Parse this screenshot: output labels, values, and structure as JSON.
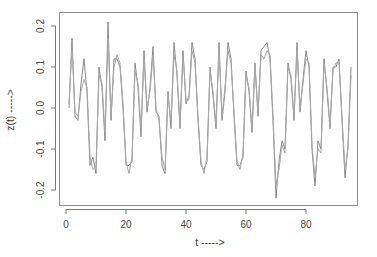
{
  "chart_data": {
    "type": "line",
    "title": "",
    "xlabel": "t ----->",
    "ylabel": "z(t) ----->",
    "xlim": [
      -1,
      97
    ],
    "ylim": [
      -0.245,
      0.23
    ],
    "xticks": [
      0,
      20,
      40,
      60,
      80
    ],
    "yticks": [
      -0.2,
      -0.1,
      0.0,
      0.1,
      0.2
    ],
    "ytick_labels": [
      "-0.2",
      "-0.1",
      "0.0",
      "0.1",
      "0.2"
    ],
    "grid": false,
    "legend": null,
    "series": [
      {
        "name": "series-1",
        "color": "#8a8a8a",
        "x": [
          1,
          2,
          3,
          4,
          5,
          6,
          7,
          8,
          9,
          10,
          11,
          12,
          13,
          14,
          15,
          16,
          17,
          18,
          19,
          20,
          21,
          22,
          23,
          24,
          25,
          26,
          27,
          28,
          29,
          30,
          31,
          32,
          33,
          34,
          35,
          36,
          37,
          38,
          39,
          40,
          41,
          42,
          43,
          44,
          45,
          46,
          47,
          48,
          49,
          50,
          51,
          52,
          53,
          54,
          55,
          56,
          57,
          58,
          59,
          60,
          61,
          62,
          63,
          64,
          65,
          66,
          67,
          68,
          69,
          70,
          71,
          72,
          73,
          74,
          75,
          76,
          77,
          78,
          79,
          80,
          81,
          82,
          83,
          84,
          85,
          86,
          87,
          88,
          89,
          90,
          91,
          92,
          93,
          94,
          95
        ],
        "values": [
          0.0,
          0.17,
          -0.02,
          -0.03,
          0.06,
          0.12,
          0.04,
          -0.14,
          -0.12,
          -0.16,
          0.1,
          0.05,
          -0.08,
          0.21,
          -0.03,
          0.12,
          0.12,
          0.1,
          0.0,
          -0.14,
          -0.14,
          -0.13,
          0.11,
          0.05,
          -0.07,
          0.14,
          -0.01,
          0.05,
          0.15,
          -0.01,
          -0.02,
          -0.14,
          -0.16,
          0.04,
          -0.05,
          0.16,
          0.08,
          -0.05,
          0.14,
          0.01,
          0.03,
          0.16,
          0.12,
          -0.03,
          -0.14,
          -0.15,
          -0.13,
          0.1,
          0.03,
          -0.05,
          0.16,
          -0.03,
          0.04,
          0.16,
          0.12,
          -0.02,
          -0.14,
          -0.14,
          -0.12,
          0.09,
          0.04,
          -0.06,
          0.11,
          -0.02,
          0.14,
          0.15,
          0.16,
          0.12,
          -0.03,
          -0.22,
          -0.13,
          -0.08,
          -0.1,
          0.11,
          0.07,
          -0.03,
          0.16,
          -0.01,
          0.07,
          0.14,
          0.1,
          -0.1,
          -0.19,
          -0.08,
          -0.1,
          0.12,
          0.04,
          -0.05,
          0.1,
          0.1,
          0.12,
          -0.03,
          -0.17,
          -0.09,
          0.1
        ]
      },
      {
        "name": "series-2",
        "color": "#a8a8a8",
        "x": [
          1,
          2,
          3,
          4,
          5,
          6,
          7,
          8,
          9,
          10,
          11,
          12,
          13,
          14,
          15,
          16,
          17,
          18,
          19,
          20,
          21,
          22,
          23,
          24,
          25,
          26,
          27,
          28,
          29,
          30,
          31,
          32,
          33,
          34,
          35,
          36,
          37,
          38,
          39,
          40,
          41,
          42,
          43,
          44,
          45,
          46,
          47,
          48,
          49,
          50,
          51,
          52,
          53,
          54,
          55,
          56,
          57,
          58,
          59,
          60,
          61,
          62,
          63,
          64,
          65,
          66,
          67,
          68,
          69,
          70,
          71,
          72,
          73,
          74,
          75,
          76,
          77,
          78,
          79,
          80,
          81,
          82,
          83,
          84,
          85,
          86,
          87,
          88,
          89,
          90,
          91,
          92,
          93,
          94,
          95
        ],
        "values": [
          0.01,
          0.15,
          -0.01,
          -0.02,
          0.04,
          0.07,
          0.05,
          -0.12,
          -0.15,
          -0.14,
          0.08,
          0.06,
          -0.06,
          0.17,
          -0.02,
          0.1,
          0.13,
          0.11,
          0.01,
          -0.13,
          -0.16,
          -0.12,
          0.09,
          0.06,
          -0.05,
          0.12,
          0.0,
          0.04,
          0.13,
          0.0,
          -0.03,
          -0.12,
          -0.15,
          0.03,
          -0.03,
          0.13,
          0.09,
          -0.04,
          0.13,
          0.02,
          0.02,
          0.14,
          0.11,
          -0.02,
          -0.13,
          -0.16,
          -0.12,
          0.09,
          0.04,
          -0.04,
          0.14,
          -0.02,
          0.05,
          0.14,
          0.11,
          -0.01,
          -0.13,
          -0.15,
          -0.11,
          0.08,
          0.05,
          -0.05,
          0.1,
          -0.01,
          0.13,
          0.12,
          0.14,
          0.13,
          -0.02,
          -0.19,
          -0.15,
          -0.09,
          -0.11,
          0.1,
          0.08,
          -0.02,
          0.14,
          0.0,
          0.06,
          0.12,
          0.11,
          -0.09,
          -0.17,
          -0.1,
          -0.11,
          0.11,
          0.05,
          -0.04,
          0.09,
          0.11,
          0.11,
          -0.02,
          -0.15,
          -0.1,
          0.08
        ]
      }
    ]
  }
}
